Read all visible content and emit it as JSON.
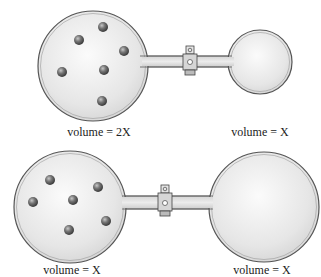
{
  "diagram": {
    "type": "gas-flasks-with-stopcock",
    "top_system": {
      "left_flask": {
        "label": "volume = 2X",
        "particles": 6
      },
      "right_flask": {
        "label": "volume = X",
        "particles": 0
      },
      "valve": "stopcock"
    },
    "bottom_system": {
      "left_flask": {
        "label": "volume = X",
        "particles": 6
      },
      "right_flask": {
        "label": "volume = X",
        "particles": 0
      },
      "valve": "stopcock"
    },
    "colors": {
      "glass_fill": "#e2e2e2",
      "glass_outline": "#555555",
      "particle": "#6a6a6a"
    }
  }
}
